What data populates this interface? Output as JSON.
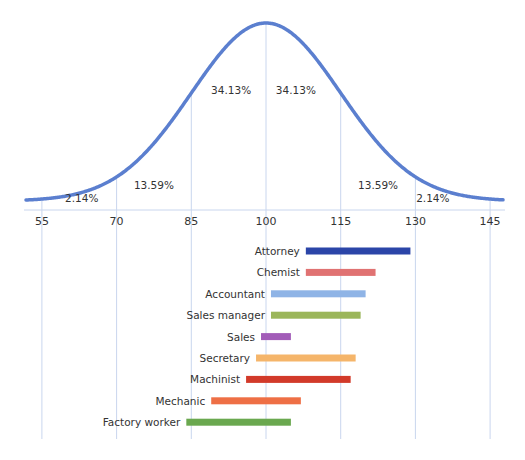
{
  "chart_data": {
    "type": "bar",
    "subtype": "normal-distribution-with-range-bars",
    "title": "",
    "xlabel": "",
    "ylabel": "",
    "x_axis": {
      "min": 53,
      "max": 148,
      "ticks": [
        55,
        70,
        85,
        100,
        115,
        130,
        145
      ],
      "tick_labels": [
        "55",
        "70",
        "85",
        "100",
        "115",
        "130",
        "145"
      ]
    },
    "distribution": {
      "type": "normal",
      "mean": 100,
      "sd": 15,
      "color": "#5b7fcf",
      "gridline_color": "#c9d6ee",
      "region_labels": [
        {
          "text": "2.14%",
          "x": 63
        },
        {
          "text": "13.59%",
          "x": 77.5
        },
        {
          "text": "34.13%",
          "x": 93
        },
        {
          "text": "34.13%",
          "x": 106
        },
        {
          "text": "13.59%",
          "x": 122.5
        },
        {
          "text": "2.14%",
          "x": 133.5
        }
      ]
    },
    "categories": [
      "Attorney",
      "Chemist",
      "Accountant",
      "Sales manager",
      "Sales",
      "Secretary",
      "Machinist",
      "Mechanic",
      "Factory worker"
    ],
    "series": [
      {
        "name": "Attorney",
        "start": 108,
        "end": 129,
        "color": "#2b45a8"
      },
      {
        "name": "Chemist",
        "start": 108,
        "end": 122,
        "color": "#e07272"
      },
      {
        "name": "Accountant",
        "start": 101,
        "end": 120,
        "color": "#8fb4e6"
      },
      {
        "name": "Sales manager",
        "start": 101,
        "end": 119,
        "color": "#9bb65a"
      },
      {
        "name": "Sales",
        "start": 99,
        "end": 105,
        "color": "#a25cb8"
      },
      {
        "name": "Secretary",
        "start": 98,
        "end": 118,
        "color": "#f5b56a"
      },
      {
        "name": "Machinist",
        "start": 96,
        "end": 117,
        "color": "#d23a2a"
      },
      {
        "name": "Mechanic",
        "start": 89,
        "end": 107,
        "color": "#ee6f45"
      },
      {
        "name": "Factory worker",
        "start": 84,
        "end": 105,
        "color": "#6aa84f"
      }
    ],
    "grid": true,
    "legend": "none"
  }
}
